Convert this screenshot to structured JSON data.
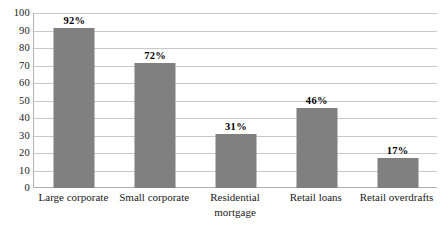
{
  "chart_data": {
    "type": "bar",
    "title": "",
    "subtitle": "",
    "xlabel": "",
    "ylabel": "",
    "categories": [
      "Large corporate",
      "Small corporate",
      "Residential\nmortgage",
      "Retail loans",
      "Retail overdrafts"
    ],
    "values": [
      92,
      72,
      31,
      46,
      17
    ],
    "data_labels": [
      "92%",
      "72%",
      "31%",
      "46%",
      "17%"
    ],
    "ylim": [
      0,
      100
    ],
    "ytick_step": 10,
    "ytick_labels": [
      "100",
      "90",
      "80",
      "70",
      "60",
      "50",
      "40",
      "30",
      "20",
      "10",
      "0"
    ],
    "grid": true,
    "legend": false,
    "legend_position": "none",
    "series": [
      {
        "name": "",
        "values": [
          92,
          72,
          31,
          46,
          17
        ]
      }
    ]
  },
  "style": {
    "bar_color": "#808080",
    "gridline_color": "#c9c9c9",
    "axis_color": "#b0b0b0",
    "text_color": "#1a1a1a",
    "background": "#ffffff"
  }
}
